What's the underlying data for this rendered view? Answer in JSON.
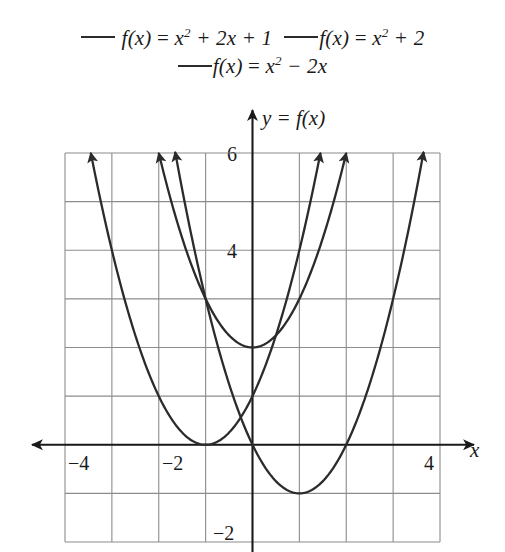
{
  "figure": {
    "background": "#ffffff",
    "curve_color": "#2b2b2b",
    "grid_color": "#8c8c8c",
    "axis_color": "#1a1a1a"
  },
  "legend": {
    "rows": [
      {
        "entries": [
          {
            "name": "legend-f1",
            "swatch": "line-swatch",
            "text_plain": "f(x) = x² + 2x + 1",
            "lhs": "f(x)",
            "eq": " = ",
            "base": "x",
            "exp": "2",
            "tail": " + 2x + 1",
            "color": "#2b2b2b"
          },
          {
            "name": "legend-f2",
            "swatch": "line-swatch",
            "text_plain": "f(x) = x² + 2",
            "lhs": "f(x)",
            "eq": " = ",
            "base": "x",
            "exp": "2",
            "tail": " + 2",
            "color": "#2b2b2b"
          }
        ]
      },
      {
        "entries": [
          {
            "name": "legend-f3",
            "swatch": "line-swatch",
            "text_plain": "f(x) = x² − 2x",
            "lhs": "f(x)",
            "eq": " = ",
            "base": "x",
            "exp": "2",
            "tail": " − 2x",
            "color": "#2b2b2b"
          }
        ]
      }
    ]
  },
  "axes": {
    "y_title": "y = f(x)",
    "x_title": "x",
    "x_tick_labels": [
      "−4",
      "−2",
      "4"
    ],
    "y_tick_labels": [
      "6",
      "4",
      "−2"
    ]
  },
  "chart_data": {
    "type": "line",
    "title": "",
    "xlabel": "x",
    "ylabel": "y = f(x)",
    "xlim": [
      -4,
      4
    ],
    "ylim": [
      -2,
      6
    ],
    "grid": true,
    "grid_step": 1,
    "legend_position": "top",
    "x_ticks_shown": [
      -4,
      -2,
      4
    ],
    "y_ticks_shown": [
      6,
      4,
      -2
    ],
    "series": [
      {
        "name": "f(x) = x² + 2x + 1",
        "expression": "x^2 + 2x + 1",
        "vertex": [
          -1,
          0
        ],
        "color": "#2b2b2b",
        "arrowheads": true,
        "points": [
          [
            -3.45,
            6.0
          ],
          [
            -3.0,
            4.0
          ],
          [
            -2.5,
            2.25
          ],
          [
            -2.0,
            1.0
          ],
          [
            -1.5,
            0.25
          ],
          [
            -1.0,
            0.0
          ],
          [
            -0.5,
            0.25
          ],
          [
            0.0,
            1.0
          ],
          [
            0.5,
            2.25
          ],
          [
            1.0,
            4.0
          ],
          [
            1.45,
            6.0
          ]
        ]
      },
      {
        "name": "f(x) = x² + 2",
        "expression": "x^2 + 2",
        "vertex": [
          0,
          2
        ],
        "color": "#2b2b2b",
        "arrowheads": true,
        "points": [
          [
            -2.0,
            6.0
          ],
          [
            -1.5,
            4.25
          ],
          [
            -1.0,
            3.0
          ],
          [
            -0.5,
            2.25
          ],
          [
            0.0,
            2.0
          ],
          [
            0.5,
            2.25
          ],
          [
            1.0,
            3.0
          ],
          [
            1.5,
            4.25
          ],
          [
            2.0,
            6.0
          ]
        ]
      },
      {
        "name": "f(x) = x² − 2x",
        "expression": "x^2 - 2x",
        "vertex": [
          1,
          -1
        ],
        "color": "#2b2b2b",
        "arrowheads": true,
        "points": [
          [
            -1.65,
            6.0
          ],
          [
            -1.0,
            3.0
          ],
          [
            -0.5,
            1.25
          ],
          [
            0.0,
            0.0
          ],
          [
            0.5,
            -0.75
          ],
          [
            1.0,
            -1.0
          ],
          [
            1.5,
            -0.75
          ],
          [
            2.0,
            0.0
          ],
          [
            2.5,
            1.25
          ],
          [
            3.0,
            3.0
          ],
          [
            3.65,
            6.0
          ]
        ]
      }
    ]
  }
}
